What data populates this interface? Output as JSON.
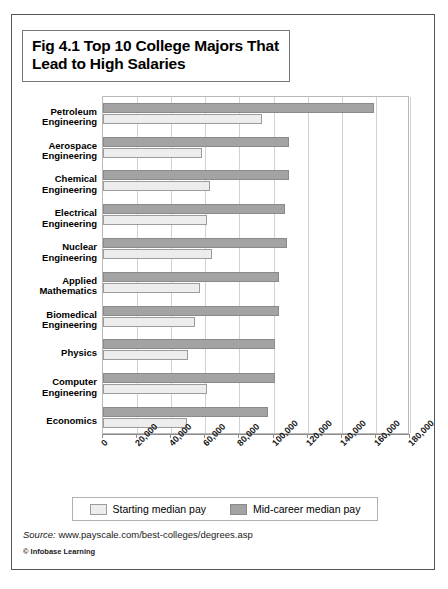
{
  "figure": {
    "title": "Fig 4.1 Top 10 College Majors That Lead to High Salaries",
    "source_label": "Source:",
    "source_url": "www.payscale.com/best-colleges/degrees.asp",
    "copyright": "© Infobase Learning"
  },
  "legend": {
    "position": "bottom",
    "items": [
      {
        "label": "Starting median pay",
        "color": "#ededed"
      },
      {
        "label": "Mid-career median pay",
        "color": "#a3a3a3"
      }
    ]
  },
  "chart_data": {
    "type": "bar",
    "orientation": "horizontal",
    "title": "Fig 4.1 Top 10 College Majors That Lead to High Salaries",
    "xlabel": "",
    "ylabel": "",
    "xlim": [
      0,
      180000
    ],
    "grid": true,
    "tick_labels": [
      "0",
      "20,000",
      "40,000",
      "60,000",
      "80,000",
      "100,000",
      "120,000",
      "140,000",
      "160,000",
      "180,000"
    ],
    "ticks": [
      0,
      20000,
      40000,
      60000,
      80000,
      100000,
      120000,
      140000,
      160000,
      180000
    ],
    "categories": [
      "Petroleum Engineering",
      "Aerospace Engineering",
      "Chemical Engineering",
      "Electrical Engineering",
      "Nuclear Engineering",
      "Applied Mathematics",
      "Biomedical Engineering",
      "Physics",
      "Computer Engineering",
      "Economics"
    ],
    "category_lines": [
      [
        "Petroleum",
        "Engineering"
      ],
      [
        "Aerospace",
        "Engineering"
      ],
      [
        "Chemical",
        "Engineering"
      ],
      [
        "Electrical",
        "Engineering"
      ],
      [
        "Nuclear",
        "Engineering"
      ],
      [
        "Applied",
        "Mathematics"
      ],
      [
        "Biomedical",
        "Engineering"
      ],
      [
        "Physics"
      ],
      [
        "Computer",
        "Engineering"
      ],
      [
        "Economics"
      ]
    ],
    "series": [
      {
        "name": "Mid-career median pay",
        "color": "#a3a3a3",
        "values": [
          159000,
          109000,
          109000,
          107000,
          108000,
          103000,
          103000,
          101000,
          101000,
          97000
        ]
      },
      {
        "name": "Starting median pay",
        "color": "#ededed",
        "values": [
          93000,
          58000,
          63000,
          61000,
          64000,
          57000,
          54000,
          50000,
          61000,
          49000
        ]
      }
    ]
  }
}
